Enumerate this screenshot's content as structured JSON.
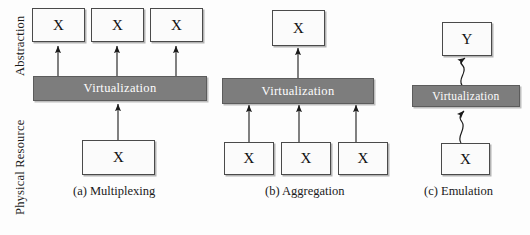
{
  "figure": {
    "width": 530,
    "height": 235,
    "background_color": "#fdfdfd",
    "virtualization_fill": "#7d7d7d",
    "box_fill": "#fbfbfb",
    "box_stroke": "#4a4a4a",
    "arrow_color": "#1a1a1a"
  },
  "axis_labels": {
    "top": "Abstraction",
    "bottom": "Physical Resource"
  },
  "panels": [
    {
      "id": "multiplexing",
      "caption": "(a) Multiplexing",
      "virtualization_label": "Virtualization",
      "top_boxes": [
        {
          "label": "X"
        },
        {
          "label": "X"
        },
        {
          "label": "X"
        }
      ],
      "bottom_boxes": [
        {
          "label": "X"
        }
      ],
      "arrow_style": "straight",
      "arrows_up": 3,
      "arrows_in": 1
    },
    {
      "id": "aggregation",
      "caption": "(b) Aggregation",
      "virtualization_label": "Virtualization",
      "top_boxes": [
        {
          "label": "X"
        }
      ],
      "bottom_boxes": [
        {
          "label": "X"
        },
        {
          "label": "X"
        },
        {
          "label": "X"
        }
      ],
      "arrow_style": "straight",
      "arrows_up": 1,
      "arrows_in": 3
    },
    {
      "id": "emulation",
      "caption": "(c) Emulation",
      "virtualization_label": "Virtualization",
      "top_boxes": [
        {
          "label": "Y"
        }
      ],
      "bottom_boxes": [
        {
          "label": "X"
        }
      ],
      "arrow_style": "wavy",
      "arrows_up": 1,
      "arrows_in": 1
    }
  ]
}
